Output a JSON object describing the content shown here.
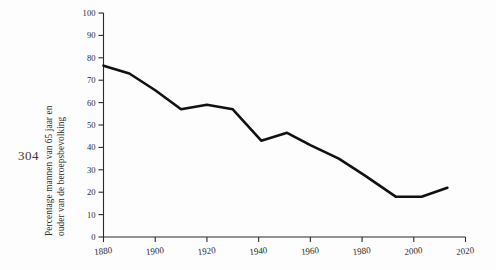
{
  "page": {
    "page_number": "304",
    "background_color": "#fdfdfd",
    "ink_color": "#111111"
  },
  "chart_data": {
    "type": "line",
    "title": "",
    "subtitle": "",
    "xlabel": "",
    "ylabel": "Percentage mannen van 65 jaar en ouder van de beroepsbevolking",
    "ylabel_line_1": "Percentage mannen van 65 jaar en",
    "ylabel_line_2": "ouder van de beroepsbevolking",
    "xlim": [
      1880,
      2020
    ],
    "ylim": [
      0,
      100
    ],
    "xticks": [
      1880,
      1900,
      1920,
      1940,
      1960,
      1980,
      2000,
      2020
    ],
    "xtick_labels": [
      "1880",
      "1900",
      "1920",
      "1940",
      "1960",
      "1980",
      "2000",
      "2020"
    ],
    "yticks": [
      0,
      10,
      20,
      30,
      40,
      50,
      60,
      70,
      80,
      90,
      100
    ],
    "ytick_labels": [
      "0",
      "10",
      "20",
      "30",
      "40",
      "50",
      "60",
      "70",
      "80",
      "90",
      "100"
    ],
    "grid": false,
    "legend": null,
    "legend_position": "none",
    "series": [
      {
        "name": "Percentage mannen van 65 jaar en ouder van de beroepsbevolking",
        "color": "#111111",
        "x": [
          1880,
          1890,
          1900,
          1910,
          1920,
          1930,
          1941,
          1951,
          1960,
          1971,
          1981,
          1993,
          2003,
          2013
        ],
        "values": [
          76.5,
          73.0,
          65.5,
          57.0,
          59.0,
          57.0,
          43.0,
          46.5,
          41.0,
          35.0,
          27.5,
          18.0,
          18.0,
          22.0
        ]
      }
    ],
    "annotations": []
  }
}
